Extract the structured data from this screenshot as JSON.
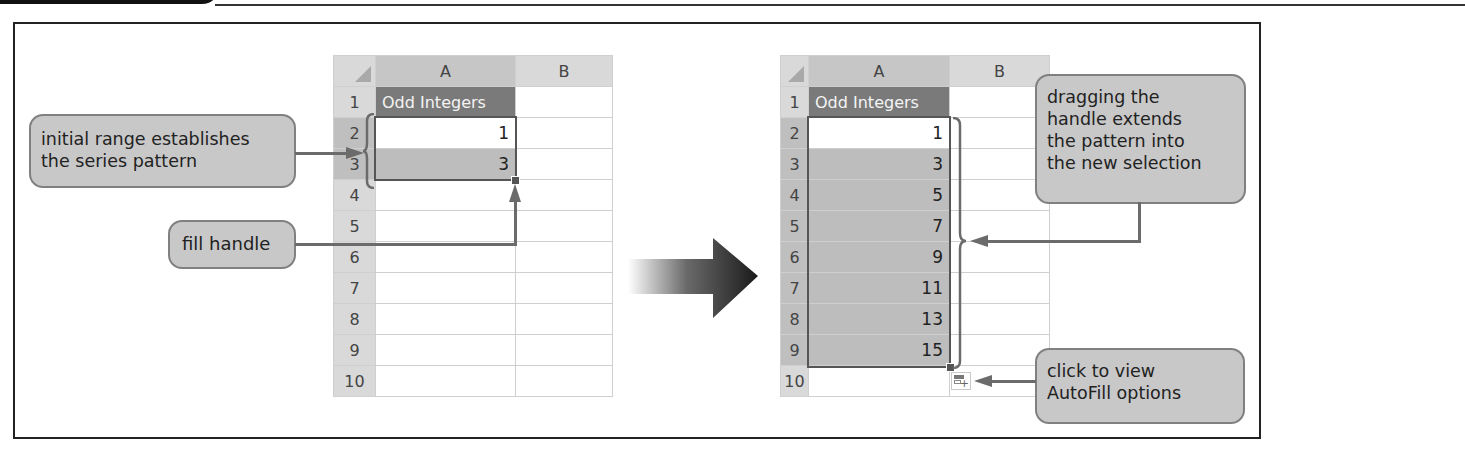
{
  "figure": {
    "header_tab_label": ""
  },
  "left_sheet": {
    "corner": "",
    "columns": [
      "A",
      "B"
    ],
    "rows": [
      {
        "n": "1",
        "a": "Odd Integers",
        "b": ""
      },
      {
        "n": "2",
        "a": "1",
        "b": ""
      },
      {
        "n": "3",
        "a": "3",
        "b": ""
      },
      {
        "n": "4",
        "a": "",
        "b": ""
      },
      {
        "n": "5",
        "a": "",
        "b": ""
      },
      {
        "n": "6",
        "a": "",
        "b": ""
      },
      {
        "n": "7",
        "a": "",
        "b": ""
      },
      {
        "n": "8",
        "a": "",
        "b": ""
      },
      {
        "n": "9",
        "a": "",
        "b": ""
      },
      {
        "n": "10",
        "a": "",
        "b": ""
      }
    ],
    "selection": "A2:A3"
  },
  "right_sheet": {
    "corner": "",
    "columns": [
      "A",
      "B"
    ],
    "rows": [
      {
        "n": "1",
        "a": "Odd Integers",
        "b": ""
      },
      {
        "n": "2",
        "a": "1",
        "b": ""
      },
      {
        "n": "3",
        "a": "3",
        "b": ""
      },
      {
        "n": "4",
        "a": "5",
        "b": ""
      },
      {
        "n": "5",
        "a": "7",
        "b": ""
      },
      {
        "n": "6",
        "a": "9",
        "b": ""
      },
      {
        "n": "7",
        "a": "11",
        "b": ""
      },
      {
        "n": "8",
        "a": "13",
        "b": ""
      },
      {
        "n": "9",
        "a": "15",
        "b": ""
      },
      {
        "n": "10",
        "a": "",
        "b": ""
      }
    ],
    "selection": "A2:A9"
  },
  "callouts": {
    "initial_range": {
      "line1": "initial range establishes",
      "line2": "the series pattern"
    },
    "fill_handle": {
      "line1": "fill handle"
    },
    "dragging": {
      "line1": "dragging the",
      "line2": "handle extends",
      "line3": "the pattern into",
      "line4": "the new selection"
    },
    "autofill": {
      "line1": "click to view",
      "line2": "AutoFill options"
    }
  },
  "icons": {
    "transition_arrow": "right-arrow-gradient",
    "autofill_options": "auto-fill-options-icon"
  },
  "colors": {
    "header_fill": "#d9d9d9",
    "title_fill": "#7a7a7a",
    "selection_fill": "#bdbdbd",
    "callout_fill": "#c8c8c8",
    "connector": "#6b6b6b"
  }
}
